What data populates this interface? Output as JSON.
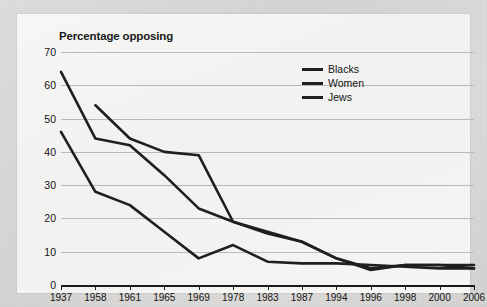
{
  "chart_data": {
    "type": "line",
    "title": "Percentage opposing",
    "xlabel": "",
    "ylabel": "",
    "ylim": [
      0,
      70
    ],
    "ytick_step": 10,
    "yticks": [
      70,
      60,
      50,
      40,
      30,
      20,
      10,
      0
    ],
    "grid": "horizontal",
    "legend_position": "top-center-right",
    "categories": [
      "1937",
      "1958",
      "1961",
      "1965",
      "1969",
      "1978",
      "1983",
      "1987",
      "1994",
      "1996",
      "1998",
      "2000",
      "2006"
    ],
    "series": [
      {
        "name": "Blacks",
        "color": "#1f1f1f",
        "values": [
          null,
          54,
          44,
          40,
          39,
          19,
          15.5,
          13,
          8,
          5,
          6,
          6,
          6
        ]
      },
      {
        "name": "Women",
        "color": "#1f1f1f",
        "values": [
          64,
          44,
          42,
          33,
          23,
          19,
          16,
          13,
          8,
          4.5,
          6,
          6,
          5
        ]
      },
      {
        "name": "Jews",
        "color": "#1f1f1f",
        "values": [
          46,
          28,
          24,
          16,
          8,
          12,
          7,
          6.5,
          6.5,
          6,
          5.5,
          5,
          5
        ]
      }
    ]
  },
  "legend": {
    "items": [
      {
        "label": "Blacks"
      },
      {
        "label": "Women"
      },
      {
        "label": "Jews"
      }
    ]
  },
  "colors": {
    "line": "#1f1f1f",
    "grid": "#b9b9b7",
    "axis": "#1a1a1a",
    "panel": "#f5f5f4",
    "background": "#d8d8d6"
  }
}
